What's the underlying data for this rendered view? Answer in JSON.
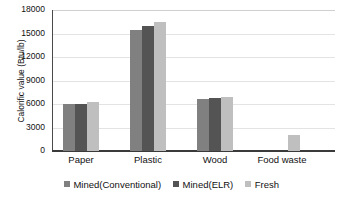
{
  "chart_data": {
    "type": "bar",
    "title": "",
    "xlabel": "",
    "ylabel": "Calorific value (Btu/lb)",
    "categories": [
      "Paper",
      "Plastic",
      "Wood",
      "Food waste"
    ],
    "series": [
      {
        "name": "Mined(Conventional)",
        "color": "#808080",
        "values": [
          6000,
          15400,
          6600,
          null
        ]
      },
      {
        "name": "Mined(ELR)",
        "color": "#545454",
        "values": [
          6000,
          16000,
          6750,
          null
        ]
      },
      {
        "name": "Fresh",
        "color": "#bfbfbf",
        "values": [
          6200,
          16500,
          6900,
          2050
        ]
      }
    ],
    "ylim": [
      0,
      18000
    ],
    "yticks": [
      0,
      3000,
      6000,
      9000,
      12000,
      15000,
      18000
    ],
    "ytick_labels": [
      "0",
      "3000",
      "6000",
      "9000",
      "12000",
      "15000",
      "18000"
    ],
    "grid": "horizontal",
    "legend_position": "bottom"
  }
}
